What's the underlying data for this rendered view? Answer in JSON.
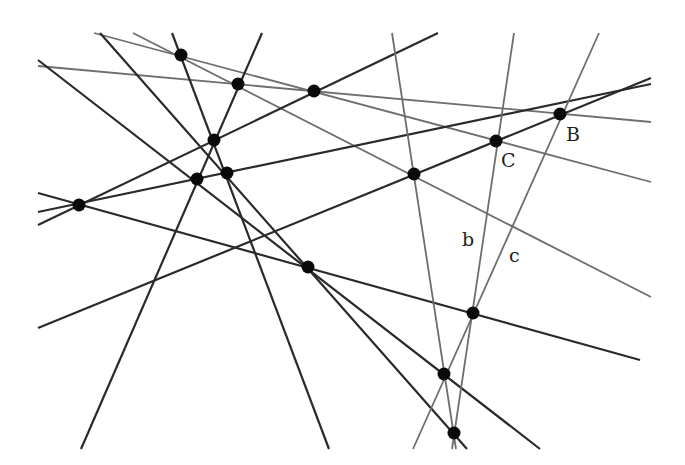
{
  "diagram": {
    "width": 685,
    "height": 465,
    "background": "#ffffff",
    "dark_color": "#2a2a2a",
    "gray_color": "#6e6e6e",
    "point_color": "#0a0a0a",
    "point_radius": 6.5,
    "lines": [
      {
        "id": "l1",
        "tone": "gray",
        "x1": 94,
        "y1": 33,
        "x2": 651,
        "y2": 182
      },
      {
        "id": "l2",
        "tone": "gray",
        "x1": 133,
        "y1": 33,
        "x2": 651,
        "y2": 297
      },
      {
        "id": "l3",
        "tone": "gray",
        "x1": 38,
        "y1": 66,
        "x2": 651,
        "y2": 122
      },
      {
        "id": "l4",
        "tone": "dark",
        "x1": 172,
        "y1": 33,
        "x2": 329,
        "y2": 449
      },
      {
        "id": "l5",
        "tone": "dark",
        "x1": 262,
        "y1": 33,
        "x2": 81,
        "y2": 449
      },
      {
        "id": "l6",
        "tone": "dark",
        "x1": 438,
        "y1": 33,
        "x2": 38,
        "y2": 225
      },
      {
        "id": "l7",
        "tone": "dark",
        "x1": 38,
        "y1": 212,
        "x2": 651,
        "y2": 84
      },
      {
        "id": "l8",
        "tone": "dark",
        "x1": 38,
        "y1": 328,
        "x2": 651,
        "y2": 78
      },
      {
        "id": "l9",
        "tone": "dark",
        "x1": 38,
        "y1": 193,
        "x2": 640,
        "y2": 360
      },
      {
        "id": "l10",
        "tone": "dark",
        "x1": 38,
        "y1": 60,
        "x2": 540,
        "y2": 449
      },
      {
        "id": "l11",
        "tone": "dark",
        "x1": 100,
        "y1": 33,
        "x2": 467,
        "y2": 449
      },
      {
        "id": "l12",
        "tone": "gray",
        "x1": 392,
        "y1": 33,
        "x2": 456,
        "y2": 449
      },
      {
        "id": "b",
        "tone": "gray",
        "x1": 514,
        "y1": 33,
        "x2": 452,
        "y2": 449
      },
      {
        "id": "c",
        "tone": "gray",
        "x1": 599,
        "y1": 33,
        "x2": 413,
        "y2": 449
      }
    ],
    "points": [
      {
        "id": "p1",
        "x": 181,
        "y": 55
      },
      {
        "id": "p2",
        "x": 238,
        "y": 84
      },
      {
        "id": "p3",
        "x": 314,
        "y": 91
      },
      {
        "id": "p4",
        "x": 214,
        "y": 140
      },
      {
        "id": "p5",
        "x": 197,
        "y": 179
      },
      {
        "id": "p6",
        "x": 227,
        "y": 173
      },
      {
        "id": "p7",
        "x": 79,
        "y": 205
      },
      {
        "id": "p8",
        "x": 414,
        "y": 174
      },
      {
        "id": "C",
        "x": 496,
        "y": 141
      },
      {
        "id": "B",
        "x": 560,
        "y": 114
      },
      {
        "id": "p11",
        "x": 308,
        "y": 267
      },
      {
        "id": "p12",
        "x": 473,
        "y": 313
      },
      {
        "id": "p13",
        "x": 444,
        "y": 374
      },
      {
        "id": "p14",
        "x": 454,
        "y": 433
      }
    ],
    "labels": [
      {
        "text": "B",
        "x": 566,
        "y": 141
      },
      {
        "text": "C",
        "x": 501,
        "y": 167
      },
      {
        "text": "b",
        "x": 462,
        "y": 246
      },
      {
        "text": "c",
        "x": 509,
        "y": 262
      }
    ]
  }
}
